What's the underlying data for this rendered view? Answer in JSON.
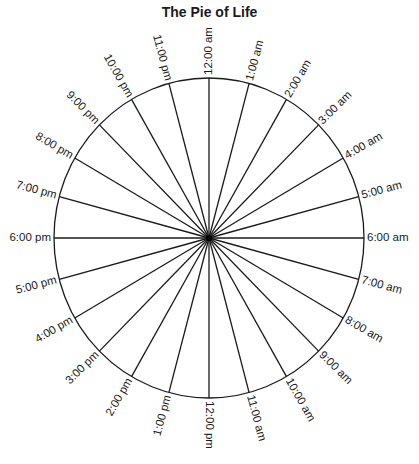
{
  "title": "The Pie of Life",
  "chart_data": {
    "type": "pie",
    "title": "The Pie of Life",
    "categories": [
      "12:00 am",
      "1:00 am",
      "2:00 am",
      "3:00 am",
      "4:00 am",
      "5:00 am",
      "6:00 am",
      "7:00 am",
      "8:00 am",
      "9:00 am",
      "10:00 am",
      "11:00 am",
      "12:00 pm",
      "1:00 pm",
      "2:00 pm",
      "3:00 pm",
      "4:00 pm",
      "5:00 pm",
      "6:00 pm",
      "7:00 pm",
      "8:00 pm",
      "9:00 pm",
      "10:00 pm",
      "11:00 pm"
    ],
    "values": [
      1,
      1,
      1,
      1,
      1,
      1,
      1,
      1,
      1,
      1,
      1,
      1,
      1,
      1,
      1,
      1,
      1,
      1,
      1,
      1,
      1,
      1,
      1,
      1
    ],
    "slices": 24,
    "start_label": "12:00 am",
    "start_position": "top",
    "direction": "clockwise"
  },
  "style": {
    "line_color": "#1a1a1a",
    "background": "#ffffff"
  }
}
